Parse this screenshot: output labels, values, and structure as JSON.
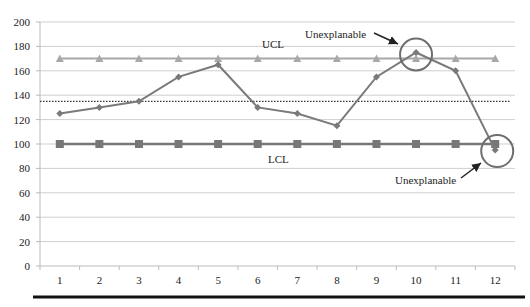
{
  "chart_data": {
    "type": "line",
    "title": "",
    "xlabel": "",
    "ylabel": "",
    "categories": [
      "1",
      "2",
      "3",
      "4",
      "5",
      "6",
      "7",
      "8",
      "9",
      "10",
      "11",
      "12"
    ],
    "ylim": [
      0,
      200
    ],
    "yticks": [
      0,
      20,
      40,
      60,
      80,
      100,
      120,
      140,
      160,
      180,
      200
    ],
    "grid": true,
    "legend": "none",
    "series": [
      {
        "name": "Measurements",
        "marker": "diamond",
        "values": [
          125,
          130,
          135,
          155,
          165,
          130,
          125,
          115,
          155,
          175,
          160,
          95
        ]
      },
      {
        "name": "UCL",
        "marker": "triangle",
        "values": [
          170,
          170,
          170,
          170,
          170,
          170,
          170,
          170,
          170,
          170,
          170,
          170
        ]
      },
      {
        "name": "LCL",
        "marker": "square",
        "values": [
          100,
          100,
          100,
          100,
          100,
          100,
          100,
          100,
          100,
          100,
          100,
          100
        ]
      },
      {
        "name": "Mean",
        "style": "dotted",
        "values": [
          135,
          135,
          135,
          135,
          135,
          135,
          135,
          135,
          135,
          135,
          135,
          135
        ]
      }
    ],
    "annotations": [
      {
        "text": "UCL",
        "near": "upper control line"
      },
      {
        "text": "LCL",
        "near": "lower control line"
      },
      {
        "text": "Unexplanable",
        "target_point": 10,
        "circled": true
      },
      {
        "text": "Unexplanable",
        "target_point": 12,
        "circled": true
      }
    ]
  },
  "labels": {
    "ucl": "UCL",
    "lcl": "LCL",
    "annotation_top": "Unexplanable",
    "annotation_bottom": "Unexplanable"
  },
  "colors": {
    "series_line": "#7a7a7a",
    "ucl_line": "#a8a8a8",
    "lcl_line": "#777777",
    "mean_line": "#333333",
    "grid": "#cfcfcf",
    "circle": "#6e6e6e",
    "bottom_rule": "#111111"
  }
}
